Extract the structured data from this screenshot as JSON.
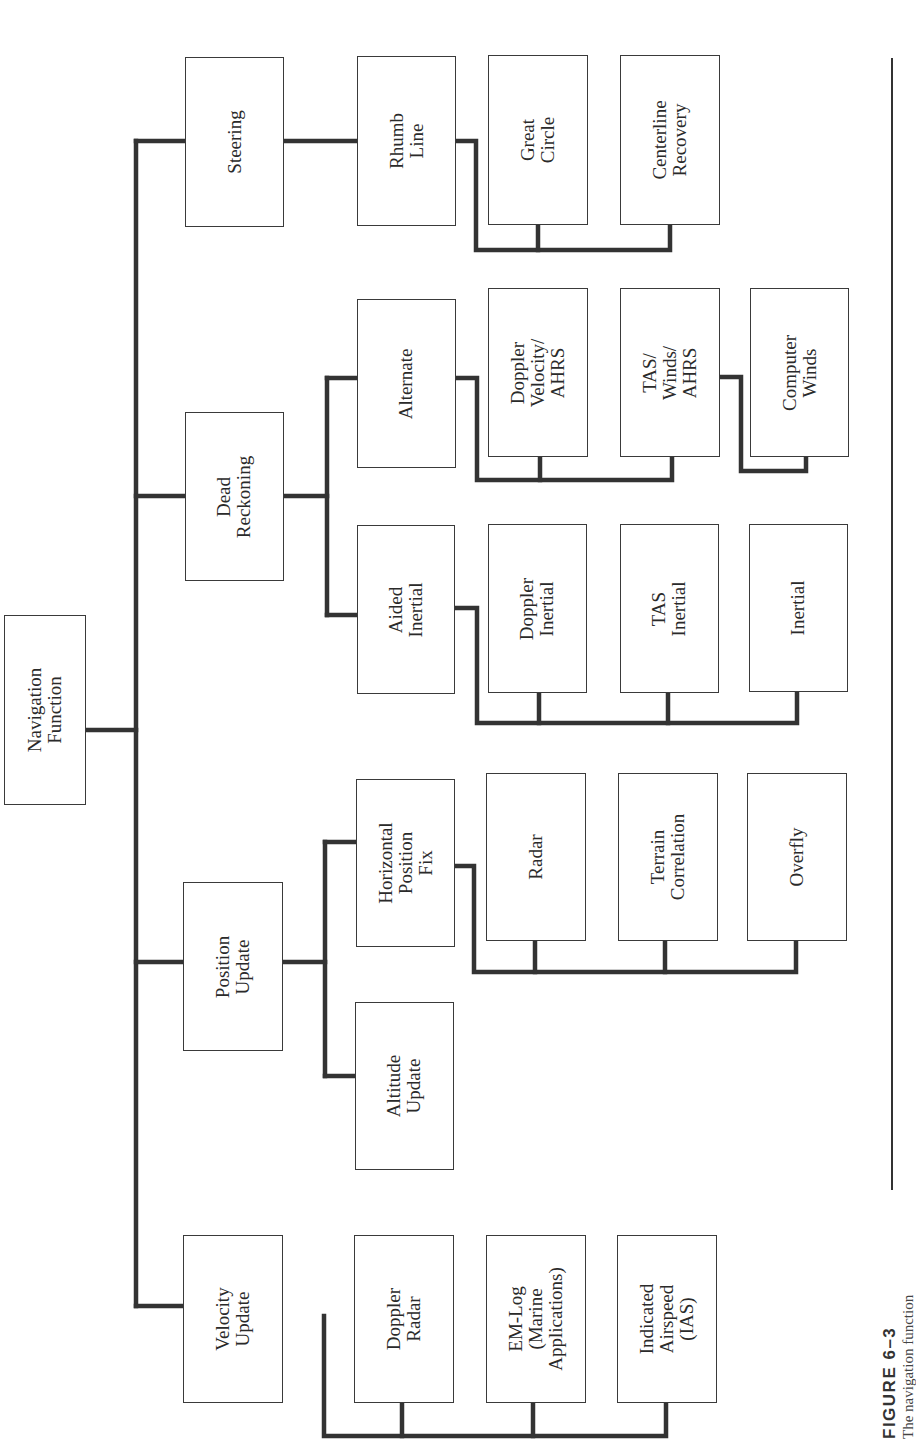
{
  "diagram": {
    "orientation": "rotated 90° counter-clockwise (text reads bottom-to-top)",
    "root": {
      "id": "nav",
      "label": "Navigation\nFunction",
      "box": [
        4,
        615,
        82,
        190
      ]
    },
    "nodes": [
      {
        "id": "steering",
        "label": "Steering",
        "box": [
          185,
          57,
          99,
          170
        ]
      },
      {
        "id": "rhumb",
        "label": "Rhumb\nLine",
        "box": [
          357,
          56,
          99,
          170
        ]
      },
      {
        "id": "great",
        "label": "Great\nCircle",
        "box": [
          488,
          55,
          100,
          170
        ]
      },
      {
        "id": "centerline",
        "label": "Centerline\nRecovery",
        "box": [
          620,
          55,
          100,
          170
        ]
      },
      {
        "id": "dead",
        "label": "Dead\nReckoning",
        "box": [
          185,
          412,
          99,
          169
        ]
      },
      {
        "id": "alternate",
        "label": "Alternate",
        "box": [
          357,
          299,
          99,
          169
        ]
      },
      {
        "id": "dopvel",
        "label": "Doppler\nVelocity/\nAHRS",
        "box": [
          488,
          288,
          100,
          169
        ]
      },
      {
        "id": "taswinds",
        "label": "TAS/\nWinds/\nAHRS",
        "box": [
          620,
          288,
          100,
          169
        ]
      },
      {
        "id": "compwinds",
        "label": "Computer\nWinds",
        "box": [
          750,
          288,
          99,
          169
        ]
      },
      {
        "id": "aided",
        "label": "Aided\nInertial",
        "box": [
          357,
          525,
          98,
          169
        ]
      },
      {
        "id": "dopinert",
        "label": "Doppler\nInertial",
        "box": [
          488,
          524,
          99,
          169
        ]
      },
      {
        "id": "tasinert",
        "label": "TAS\nInertial",
        "box": [
          620,
          524,
          99,
          169
        ]
      },
      {
        "id": "inertial",
        "label": "Inertial",
        "box": [
          749,
          524,
          99,
          168
        ]
      },
      {
        "id": "position",
        "label": "Position\nUpdate",
        "box": [
          183,
          882,
          100,
          169
        ]
      },
      {
        "id": "horiz",
        "label": "Horizontal\nPosition\nFix",
        "box": [
          356,
          779,
          99,
          168
        ]
      },
      {
        "id": "radar",
        "label": "Radar",
        "box": [
          486,
          773,
          100,
          168
        ]
      },
      {
        "id": "terrain",
        "label": "Terrain\nCorrelation",
        "box": [
          618,
          773,
          100,
          168
        ]
      },
      {
        "id": "overfly",
        "label": "Overfly",
        "box": [
          747,
          773,
          100,
          168
        ]
      },
      {
        "id": "altitude",
        "label": "Altitude\nUpdate",
        "box": [
          355,
          1002,
          99,
          168
        ]
      },
      {
        "id": "velocity",
        "label": "Velocity\nUpdate",
        "box": [
          183,
          1235,
          100,
          168
        ]
      },
      {
        "id": "dopradar",
        "label": "Doppler\nRadar",
        "box": [
          354,
          1235,
          100,
          168
        ]
      },
      {
        "id": "emlog",
        "label": "EM-Log\n(Marine\nApplications)",
        "box": [
          486,
          1235,
          100,
          168
        ]
      },
      {
        "id": "ias",
        "label": "Indicated\nAirspeed\n(IAS)",
        "box": [
          617,
          1235,
          100,
          168
        ]
      }
    ],
    "edges": [
      [
        "nav",
        "steering"
      ],
      [
        "nav",
        "dead"
      ],
      [
        "nav",
        "position"
      ],
      [
        "nav",
        "velocity"
      ],
      [
        "steering",
        "rhumb"
      ],
      [
        "steering",
        "great"
      ],
      [
        "steering",
        "centerline"
      ],
      [
        "dead",
        "alternate"
      ],
      [
        "dead",
        "aided"
      ],
      [
        "alternate",
        "dopvel"
      ],
      [
        "alternate",
        "taswinds"
      ],
      [
        "taswinds",
        "compwinds"
      ],
      [
        "aided",
        "dopinert"
      ],
      [
        "aided",
        "tasinert"
      ],
      [
        "aided",
        "inertial"
      ],
      [
        "position",
        "horiz"
      ],
      [
        "position",
        "altitude"
      ],
      [
        "horiz",
        "radar"
      ],
      [
        "horiz",
        "terrain"
      ],
      [
        "horiz",
        "overfly"
      ],
      [
        "velocity",
        "dopradar"
      ],
      [
        "velocity",
        "emlog"
      ],
      [
        "velocity",
        "ias"
      ]
    ],
    "line_color": "#333333",
    "box_border_color": "#3a3a3a"
  },
  "caption": {
    "figure_label": "FIGURE 6–3",
    "description": "The navigation function"
  }
}
